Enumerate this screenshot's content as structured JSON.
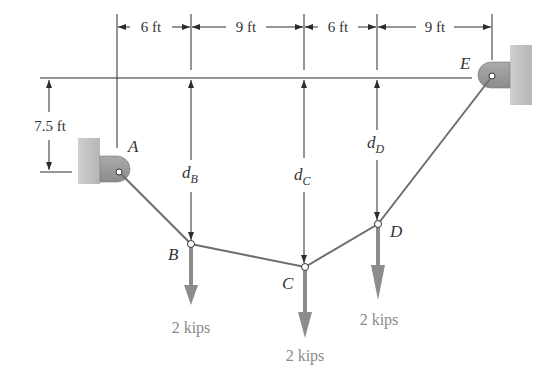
{
  "figure": {
    "type": "cable-statics-diagram",
    "colors": {
      "line": "#2b2b2b",
      "cable": "#6e6e6e",
      "load_arrow": "#8c8c8c",
      "load_text": "#8a8a8a",
      "wall": "#c4c4c4",
      "bracket": "#9a9a9a"
    },
    "supports": [
      {
        "id": "A",
        "label": "A"
      },
      {
        "id": "E",
        "label": "E"
      }
    ],
    "points": [
      {
        "id": "A",
        "label": "A"
      },
      {
        "id": "B",
        "label": "B"
      },
      {
        "id": "C",
        "label": "C"
      },
      {
        "id": "D",
        "label": "D"
      },
      {
        "id": "E",
        "label": "E"
      }
    ],
    "horizontal_dimensions": [
      {
        "label": "6 ft",
        "from": "A",
        "to": "B"
      },
      {
        "label": "9 ft",
        "from": "B",
        "to": "C"
      },
      {
        "label": "6 ft",
        "from": "C",
        "to": "D"
      },
      {
        "label": "9 ft",
        "from": "D",
        "to": "E"
      }
    ],
    "vertical_dimension": {
      "label": "7.5 ft",
      "from": "E-level",
      "to": "A"
    },
    "sag_labels": [
      {
        "id": "dB",
        "main": "d",
        "sub": "B"
      },
      {
        "id": "dC",
        "main": "d",
        "sub": "C"
      },
      {
        "id": "dD",
        "main": "d",
        "sub": "D"
      }
    ],
    "loads": [
      {
        "at": "B",
        "label": "2 kips"
      },
      {
        "at": "C",
        "label": "2 kips"
      },
      {
        "at": "D",
        "label": "2 kips"
      }
    ]
  }
}
